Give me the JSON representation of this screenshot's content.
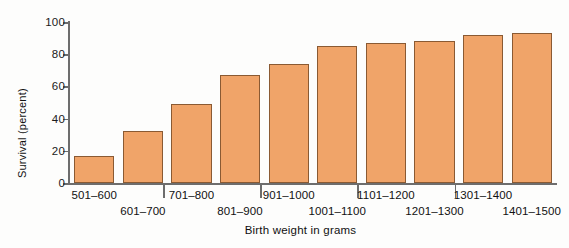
{
  "chart_data": {
    "type": "bar",
    "title": "",
    "xlabel": "Birth weight in grams",
    "ylabel": "Survival (percent)",
    "categories": [
      "501-600",
      "601-700",
      "701-800",
      "801-900",
      "901-1000",
      "1001-1100",
      "1101-1200",
      "1201-1300",
      "1301-1400",
      "1401-1500"
    ],
    "values": [
      17,
      32,
      49,
      67,
      74,
      85,
      87,
      88,
      92,
      93
    ],
    "ylim": [
      0,
      100
    ],
    "yticks": [
      0,
      20,
      40,
      60,
      80,
      100
    ],
    "ytick_labels": [
      "0",
      "20",
      "40",
      "60",
      "80",
      "100"
    ],
    "grid": false,
    "legend": false,
    "bar_fill_color": "#f0a469",
    "bar_border_color": "#8a5a33",
    "axis_color": "#6d6d6d",
    "background_color": "#fdfdfc"
  }
}
